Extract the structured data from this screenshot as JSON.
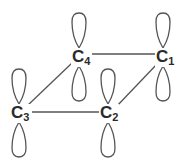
{
  "diagram": {
    "type": "molecular-orbital",
    "colors": {
      "stroke": "#555555",
      "label": "#2a2a2a",
      "background": "#ffffff"
    },
    "atoms": [
      {
        "id": "C1",
        "element": "C",
        "subscript": "1",
        "x": 163,
        "y": 57
      },
      {
        "id": "C2",
        "element": "C",
        "subscript": "2",
        "x": 108,
        "y": 112
      },
      {
        "id": "C3",
        "element": "C",
        "subscript": "3",
        "x": 20,
        "y": 112
      },
      {
        "id": "C4",
        "element": "C",
        "subscript": "4",
        "x": 80,
        "y": 57
      }
    ],
    "bonds": [
      {
        "from": "C4",
        "to": "C1"
      },
      {
        "from": "C1",
        "to": "C2"
      },
      {
        "from": "C2",
        "to": "C3"
      },
      {
        "from": "C3",
        "to": "C4"
      }
    ],
    "orbitals": [
      {
        "atom": "C1",
        "type": "p",
        "orientation": "vertical"
      },
      {
        "atom": "C2",
        "type": "p",
        "orientation": "vertical"
      },
      {
        "atom": "C3",
        "type": "p",
        "orientation": "vertical"
      },
      {
        "atom": "C4",
        "type": "p",
        "orientation": "vertical"
      }
    ]
  }
}
